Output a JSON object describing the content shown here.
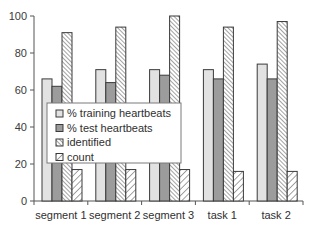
{
  "chart_data": {
    "type": "bar",
    "title": "",
    "xlabel": "",
    "ylabel": "",
    "ylim": [
      0,
      100
    ],
    "yticks": [
      0,
      20,
      40,
      60,
      80,
      100
    ],
    "grid": false,
    "legend_position": "inside-left-middle",
    "categories": [
      "segment 1",
      "segment 2",
      "segment 3",
      "task 1",
      "task 2"
    ],
    "series": [
      {
        "name": "% training heartbeats",
        "values": [
          66,
          71,
          71,
          71,
          74
        ],
        "fill": "#e2e2e2",
        "pattern": "solid"
      },
      {
        "name": "% test heartbeats",
        "values": [
          62,
          64,
          68,
          66,
          66
        ],
        "fill": "#9c9c9c",
        "pattern": "solid"
      },
      {
        "name": "identified",
        "values": [
          91,
          94,
          100,
          94,
          97
        ],
        "fill": "#ffffff",
        "pattern": "fine-diagonal-down"
      },
      {
        "name": "count",
        "values": [
          17,
          17,
          17,
          16,
          16
        ],
        "fill": "#ffffff",
        "pattern": "wide-diagonal-up"
      }
    ]
  },
  "colors": {
    "axis": "#555555",
    "bar_outline": "#3a3a3a",
    "hatch": "#555555"
  }
}
